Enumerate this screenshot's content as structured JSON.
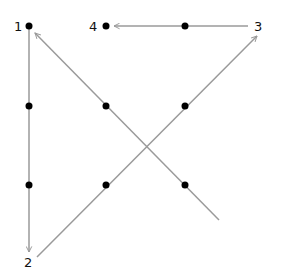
{
  "diagram": {
    "colors": {
      "line": "#9a9a9a",
      "dot": "#000000",
      "label": "#111111"
    },
    "dots": [
      {
        "x": 29,
        "y": 26
      },
      {
        "x": 106,
        "y": 26
      },
      {
        "x": 185,
        "y": 26
      },
      {
        "x": 29,
        "y": 106
      },
      {
        "x": 106,
        "y": 106
      },
      {
        "x": 185,
        "y": 106
      },
      {
        "x": 29,
        "y": 185
      },
      {
        "x": 106,
        "y": 185
      },
      {
        "x": 185,
        "y": 185
      }
    ],
    "labels": [
      {
        "text": "1",
        "x": 14,
        "y": 31
      },
      {
        "text": "2",
        "x": 24,
        "y": 267
      },
      {
        "text": "3",
        "x": 254,
        "y": 31
      },
      {
        "text": "4",
        "x": 89,
        "y": 31
      }
    ],
    "segments": [
      {
        "from": [
          29,
          26
        ],
        "to": [
          29,
          252
        ],
        "arrow": true
      },
      {
        "from": [
          37,
          257
        ],
        "to": [
          257,
          36
        ],
        "arrow": true
      },
      {
        "from": [
          248,
          26
        ],
        "to": [
          114,
          26
        ],
        "arrow": true
      },
      {
        "from": [
          219,
          220
        ],
        "to": [
          35,
          33
        ],
        "arrow": true
      }
    ]
  }
}
